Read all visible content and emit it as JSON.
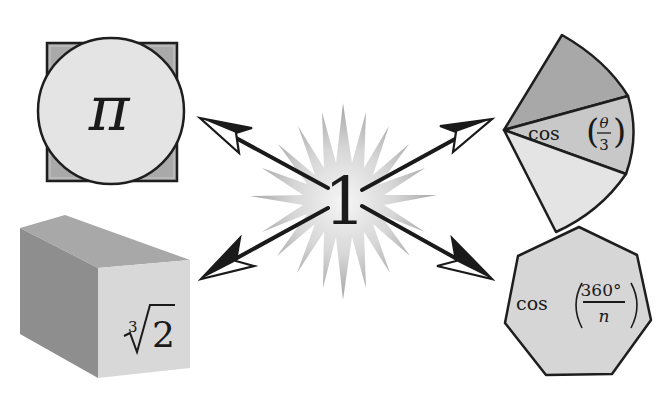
{
  "diagram": {
    "center": {
      "label": "1",
      "shape": "starburst"
    },
    "nodes": [
      {
        "id": "pi",
        "label": "π",
        "shape": "circle-over-square",
        "position": "top-left"
      },
      {
        "id": "cube-root-2",
        "label_index": "3",
        "label_radicand": "2",
        "label": "∛2",
        "shape": "cube",
        "position": "bottom-left"
      },
      {
        "id": "cos-theta-3",
        "label_func": "cos",
        "label_num": "θ",
        "label_den": "3",
        "label": "cos(θ/3)",
        "shape": "circular-sector-trisected",
        "position": "top-right"
      },
      {
        "id": "cos-360-n",
        "label_func": "cos",
        "label_num": "360°",
        "label_den": "n",
        "label": "cos(360°/n)",
        "shape": "heptagon",
        "position": "bottom-right"
      }
    ],
    "edges": [
      {
        "from": "center",
        "to": "pi",
        "style": "arrow"
      },
      {
        "from": "center",
        "to": "cos-theta-3",
        "style": "arrow"
      },
      {
        "from": "center",
        "to": "cube-root-2",
        "style": "arrow"
      },
      {
        "from": "center",
        "to": "cos-360-n",
        "style": "arrow"
      }
    ],
    "colors": {
      "stroke": "#1e1e1e",
      "light_fill": "#e2e2e2",
      "mid_fill": "#c4c4c4",
      "dark_fill": "#a6a6a6",
      "star_center": "#f4f4f4",
      "star_edge": "#a0a0a0"
    }
  }
}
